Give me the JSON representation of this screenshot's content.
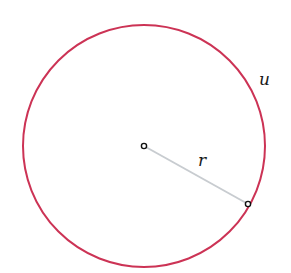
{
  "diagram": {
    "circle": {
      "label": "u",
      "color": "#cc3355",
      "cx": 144,
      "cy": 146,
      "r": 121
    },
    "radius": {
      "label": "r",
      "color": "#c8ccd0"
    },
    "center_point": {
      "x": 144,
      "y": 146
    },
    "edge_point": {
      "x": 248,
      "y": 204
    }
  }
}
